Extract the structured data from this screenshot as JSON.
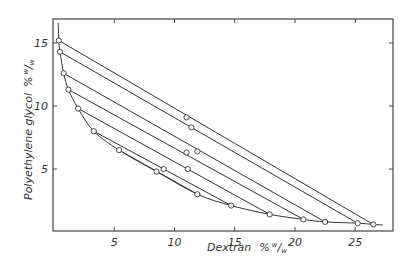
{
  "chart_data": {
    "type": "line",
    "title": "",
    "xlabel": "Dextran % w/w",
    "ylabel": "Polyethylene glycol % w/w",
    "xlabel_main": "Dextran",
    "xlabel_unit": "%",
    "ylabel_main": "Polyethylene glycol",
    "ylabel_unit": "%",
    "unit_sup": "w",
    "unit_sub": "w",
    "xlim": [
      0,
      28
    ],
    "ylim": [
      0,
      17
    ],
    "x_ticks": [
      5,
      10,
      15,
      20,
      25
    ],
    "y_ticks": [
      5,
      10,
      15
    ],
    "grid": false,
    "colors": {
      "line": "#333333",
      "frame": "#444444",
      "marker_fill": "#ffffff"
    },
    "binodal": {
      "name": "binodal curve",
      "x": [
        0.35,
        0.4,
        0.5,
        0.8,
        1.2,
        2.0,
        3.3,
        5.4,
        8.5,
        11.9,
        14.7,
        17.9,
        20.7,
        22.5,
        25.2,
        26.5,
        27.3
      ],
      "y": [
        16.6,
        15.2,
        14.3,
        12.6,
        11.3,
        9.8,
        8.0,
        6.5,
        4.8,
        3.0,
        2.1,
        1.4,
        1.0,
        0.8,
        0.7,
        0.6,
        0.55
      ]
    },
    "tie_lines": [
      {
        "top": [
          0.4,
          15.2
        ],
        "mid": [
          11.0,
          9.1
        ],
        "bottom": [
          26.5,
          0.6
        ]
      },
      {
        "top": [
          0.5,
          14.3
        ],
        "mid": [
          11.4,
          8.3
        ],
        "bottom": [
          25.2,
          0.7
        ]
      },
      {
        "top": [
          0.8,
          12.6
        ],
        "mid": [
          11.9,
          6.4
        ],
        "bottom": [
          22.5,
          0.8
        ]
      },
      {
        "top": [
          1.2,
          11.3
        ],
        "mid": [
          11.0,
          6.3
        ],
        "bottom": [
          20.7,
          1.0
        ]
      },
      {
        "top": [
          2.0,
          9.8
        ],
        "mid": [
          11.1,
          5.0
        ],
        "bottom": [
          17.9,
          1.4
        ]
      },
      {
        "top": [
          3.3,
          8.0
        ],
        "mid": [
          9.1,
          5.0
        ],
        "bottom": [
          14.7,
          2.1
        ]
      },
      {
        "top": [
          5.4,
          6.5
        ],
        "mid": [
          8.5,
          4.8
        ],
        "bottom": [
          11.9,
          3.0
        ]
      }
    ]
  }
}
